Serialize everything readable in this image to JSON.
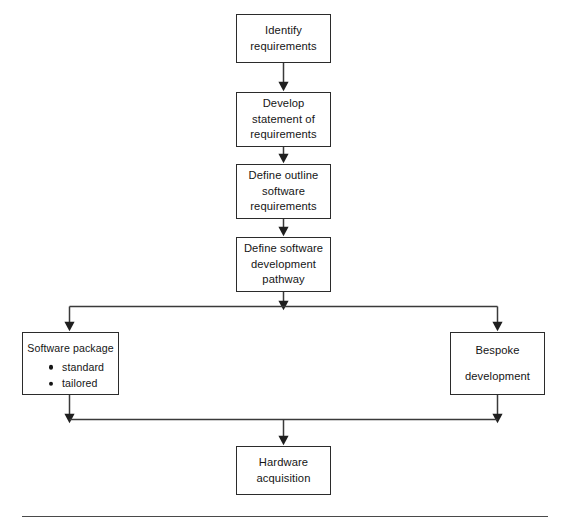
{
  "diagram": {
    "style": {
      "background": "#ffffff",
      "line_color": "#2b2b2b",
      "box_border": "#2b2b2b",
      "text_color": "#151515",
      "rule_color": "#4a4a4a"
    },
    "nodes": {
      "identify": {
        "lines": [
          "Identify",
          "requirements"
        ]
      },
      "develop": {
        "lines": [
          "Develop",
          "statement of",
          "requirements"
        ]
      },
      "outline": {
        "lines": [
          "Define outline",
          "software",
          "requirements"
        ]
      },
      "pathway": {
        "lines": [
          "Define software",
          "development",
          "pathway"
        ]
      },
      "package": {
        "title": "Software package",
        "bullets": [
          "standard",
          "tailored"
        ]
      },
      "bespoke": {
        "lines": [
          "Bespoke",
          "development"
        ]
      },
      "hardware": {
        "lines": [
          "Hardware",
          "acquisition"
        ]
      }
    },
    "connectors": [
      {
        "name": "identify-to-develop",
        "kind": "arrow-down"
      },
      {
        "name": "develop-to-outline",
        "kind": "arrow-down"
      },
      {
        "name": "outline-to-pathway",
        "kind": "arrow-down"
      },
      {
        "name": "pathway-to-split",
        "kind": "arrow-down"
      },
      {
        "name": "split-bar",
        "kind": "horizontal-bar"
      },
      {
        "name": "split-to-package",
        "kind": "arrow-down"
      },
      {
        "name": "split-to-bespoke",
        "kind": "arrow-down"
      },
      {
        "name": "package-to-merge",
        "kind": "arrow-down"
      },
      {
        "name": "bespoke-to-merge",
        "kind": "arrow-down"
      },
      {
        "name": "merge-bar",
        "kind": "horizontal-bar"
      },
      {
        "name": "merge-to-hardware",
        "kind": "arrow-down"
      }
    ],
    "footer_rule": true
  }
}
